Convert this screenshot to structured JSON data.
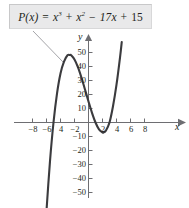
{
  "figure": {
    "name": "polynomial-graph",
    "background_color": "#ffffff",
    "curve_color": "#3b3b3e",
    "axis_color": "#6e6e72",
    "leader_line_color": "#9a9a9e"
  },
  "equation_box": {
    "background_color": "#e9e9ea",
    "border_color": "#c8c8c9",
    "text_plain": "P(x) = x³ + x² − 17x + 15",
    "parts": {
      "func": "P(x)",
      "equals": "=",
      "term1_base": "x",
      "term1_exp": "3",
      "plus1": "+",
      "term2_base": "x",
      "term2_exp": "2",
      "minus": "−",
      "term3": "17x",
      "plus2": "+",
      "term4": "15"
    }
  },
  "axes": {
    "x_label": "x",
    "y_label": "y",
    "x_ticks": [
      {
        "value": -8,
        "label": "−8"
      },
      {
        "value": -6,
        "label": "−6"
      },
      {
        "value": -4,
        "label": "4"
      },
      {
        "value": -2,
        "label": "−2"
      },
      {
        "value": 2,
        "label": "2"
      },
      {
        "value": 4,
        "label": "4"
      },
      {
        "value": 6,
        "label": "6"
      },
      {
        "value": 8,
        "label": "8"
      }
    ],
    "y_ticks": [
      {
        "value": 50,
        "label": "50"
      },
      {
        "value": 40,
        "label": "40"
      },
      {
        "value": 30,
        "label": "30"
      },
      {
        "value": 20,
        "label": "20"
      },
      {
        "value": 10,
        "label": "10"
      },
      {
        "value": -10,
        "label": "−10"
      },
      {
        "value": -20,
        "label": "−20"
      },
      {
        "value": -30,
        "label": "−30"
      },
      {
        "value": -40,
        "label": "−40"
      },
      {
        "value": -50,
        "label": "−50"
      }
    ]
  },
  "chart_data": {
    "type": "line",
    "xlabel": "x",
    "ylabel": "y",
    "xlim": [
      -9.2,
      9.6
    ],
    "ylim": [
      -58,
      58
    ],
    "grid": false,
    "legend": null,
    "annotations": [
      {
        "text": "P(x) = x³ + x² − 17x + 15",
        "kind": "callout-box",
        "points_to_x": -2.63,
        "points_to_y": 48
      }
    ],
    "function": "x^3 + x^2 - 17x + 15",
    "roots": [
      -5,
      1,
      3
    ],
    "local_max": {
      "x": -2.63,
      "y": 48.2
    },
    "local_min": {
      "x": 2.15,
      "y": -9.1
    },
    "y_intercept": 15,
    "domain_drawn": [
      -6.25,
      4.75
    ],
    "series": [
      {
        "name": "P(x)",
        "color": "#3b3b3e",
        "x": [
          -6.25,
          -6.0,
          -5.5,
          -5.0,
          -4.5,
          -4.0,
          -3.5,
          -3.0,
          -2.63,
          -2.5,
          -2.0,
          -1.5,
          -1.0,
          -0.5,
          0.0,
          0.5,
          1.0,
          1.5,
          2.0,
          2.15,
          2.5,
          3.0,
          3.5,
          4.0,
          4.5,
          4.75
        ],
        "y": [
          -83.8,
          -63.0,
          -27.6,
          0.0,
          20.6,
          35.0,
          43.4,
          48.0,
          48.2,
          48.1,
          45.0,
          39.4,
          32.0,
          23.6,
          15.0,
          6.9,
          0.0,
          -4.9,
          -7.0,
          -7.1,
          -5.6,
          0.0,
          11.6,
          27.0,
          46.4,
          57.5
        ]
      }
    ]
  }
}
